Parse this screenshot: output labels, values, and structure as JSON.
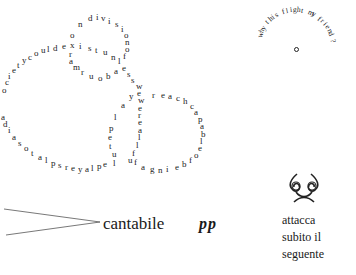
{
  "graphic_text": {
    "loop_letters": [
      {
        "c": "n",
        "x": 78,
        "y": 20
      },
      {
        "c": "d",
        "x": 88,
        "y": 14
      },
      {
        "c": "i",
        "x": 96,
        "y": 13
      },
      {
        "c": "v",
        "x": 101,
        "y": 14
      },
      {
        "c": "i",
        "x": 108,
        "y": 17
      },
      {
        "c": "s",
        "x": 115,
        "y": 20
      },
      {
        "c": "i",
        "x": 121,
        "y": 25
      },
      {
        "c": "o",
        "x": 124,
        "y": 31
      },
      {
        "c": "n",
        "x": 125,
        "y": 38
      },
      {
        "c": "o",
        "x": 125,
        "y": 45
      },
      {
        "c": "f",
        "x": 123,
        "y": 52
      },
      {
        "c": "o",
        "x": 70,
        "y": 31
      },
      {
        "c": "e",
        "x": 62,
        "y": 42
      },
      {
        "c": "x",
        "x": 70,
        "y": 41
      },
      {
        "c": "i",
        "x": 79,
        "y": 42
      },
      {
        "c": "s",
        "x": 88,
        "y": 44
      },
      {
        "c": "t",
        "x": 95,
        "y": 46
      },
      {
        "c": "u",
        "x": 103,
        "y": 48
      },
      {
        "c": "n",
        "x": 111,
        "y": 53
      },
      {
        "c": "l",
        "x": 118,
        "y": 57
      },
      {
        "c": "e",
        "x": 122,
        "y": 64
      },
      {
        "c": "s",
        "x": 127,
        "y": 70
      },
      {
        "c": "s",
        "x": 131,
        "y": 76
      },
      {
        "c": "r",
        "x": 69,
        "y": 50
      },
      {
        "c": "a",
        "x": 69,
        "y": 57
      },
      {
        "c": "m",
        "x": 73,
        "y": 63
      },
      {
        "c": "r",
        "x": 81,
        "y": 68
      },
      {
        "c": "u",
        "x": 89,
        "y": 72
      },
      {
        "c": "o",
        "x": 98,
        "y": 74
      },
      {
        "c": "b",
        "x": 106,
        "y": 72
      },
      {
        "c": "a",
        "x": 114,
        "y": 67
      },
      {
        "c": "d",
        "x": 53,
        "y": 44
      },
      {
        "c": "l",
        "x": 47,
        "y": 45
      },
      {
        "c": "u",
        "x": 41,
        "y": 46
      },
      {
        "c": "o",
        "x": 34,
        "y": 49
      },
      {
        "c": "c",
        "x": 28,
        "y": 53
      },
      {
        "c": "y",
        "x": 22,
        "y": 56
      },
      {
        "c": "t",
        "x": 17,
        "y": 61
      },
      {
        "c": "e",
        "x": 12,
        "y": 66
      },
      {
        "c": "i",
        "x": 8,
        "y": 72
      },
      {
        "c": "c",
        "x": 5,
        "y": 78
      },
      {
        "c": "o",
        "x": 2,
        "y": 86
      },
      {
        "c": "w",
        "x": 136,
        "y": 82
      },
      {
        "c": "e",
        "x": 137,
        "y": 89
      },
      {
        "c": "w",
        "x": 138,
        "y": 96
      },
      {
        "c": "e",
        "x": 138,
        "y": 104
      },
      {
        "c": "r",
        "x": 138,
        "y": 111
      },
      {
        "c": "e",
        "x": 138,
        "y": 118
      },
      {
        "c": "a",
        "x": 138,
        "y": 126
      },
      {
        "c": "l",
        "x": 138,
        "y": 133
      },
      {
        "c": "l",
        "x": 136,
        "y": 141
      },
      {
        "c": "f",
        "x": 132,
        "y": 149
      },
      {
        "c": "u",
        "x": 128,
        "y": 156
      },
      {
        "c": "y",
        "x": 129,
        "y": 92
      },
      {
        "c": "a",
        "x": 121,
        "y": 101
      },
      {
        "c": "l",
        "x": 114,
        "y": 113
      },
      {
        "c": "p",
        "x": 109,
        "y": 124
      },
      {
        "c": "e",
        "x": 108,
        "y": 133
      },
      {
        "c": "t",
        "x": 109,
        "y": 142
      },
      {
        "c": "u",
        "x": 112,
        "y": 150
      },
      {
        "c": "l",
        "x": 113,
        "y": 159
      },
      {
        "c": "f",
        "x": 134,
        "y": 158
      },
      {
        "c": "a",
        "x": 141,
        "y": 163
      },
      {
        "c": "g",
        "x": 150,
        "y": 165
      },
      {
        "c": "n",
        "x": 158,
        "y": 166
      },
      {
        "c": "i",
        "x": 166,
        "y": 165
      },
      {
        "c": "e",
        "x": 175,
        "y": 163
      },
      {
        "c": "b",
        "x": 182,
        "y": 160
      },
      {
        "c": "f",
        "x": 189,
        "y": 156
      },
      {
        "c": "o",
        "x": 194,
        "y": 151
      },
      {
        "c": "e",
        "x": 198,
        "y": 144
      },
      {
        "c": "l",
        "x": 200,
        "y": 137
      },
      {
        "c": "b",
        "x": 201,
        "y": 130
      },
      {
        "c": "a",
        "x": 200,
        "y": 122
      },
      {
        "c": "p",
        "x": 198,
        "y": 115
      },
      {
        "c": "a",
        "x": 194,
        "y": 108
      },
      {
        "c": "c",
        "x": 190,
        "y": 102
      },
      {
        "c": "h",
        "x": 183,
        "y": 97
      },
      {
        "c": "c",
        "x": 176,
        "y": 94
      },
      {
        "c": "a",
        "x": 168,
        "y": 92
      },
      {
        "c": "e",
        "x": 161,
        "y": 91
      },
      {
        "c": "r",
        "x": 152,
        "y": 91
      },
      {
        "c": "e",
        "x": 103,
        "y": 160
      },
      {
        "c": "p",
        "x": 97,
        "y": 162
      },
      {
        "c": "l",
        "x": 91,
        "y": 164
      },
      {
        "c": "a",
        "x": 85,
        "y": 165
      },
      {
        "c": "y",
        "x": 78,
        "y": 165
      },
      {
        "c": "e",
        "x": 71,
        "y": 164
      },
      {
        "c": "r",
        "x": 65,
        "y": 163
      },
      {
        "c": "s",
        "x": 58,
        "y": 161
      },
      {
        "c": "p",
        "x": 51,
        "y": 159
      },
      {
        "c": "l",
        "x": 45,
        "y": 156
      },
      {
        "c": "a",
        "x": 38,
        "y": 153
      },
      {
        "c": "t",
        "x": 31,
        "y": 149
      },
      {
        "c": "o",
        "x": 24,
        "y": 144
      },
      {
        "c": "s",
        "x": 18,
        "y": 139
      },
      {
        "c": "a",
        "x": 12,
        "y": 133
      },
      {
        "c": "i",
        "x": 8,
        "y": 126
      },
      {
        "c": "d",
        "x": 3,
        "y": 120
      },
      {
        "c": "a",
        "x": 1,
        "y": 113
      }
    ],
    "arc_phrase": "why this flight my friend ?"
  },
  "markings": {
    "tempo": "cantabile",
    "dynamic": "pp",
    "attacca_lines": [
      "attacca",
      "subito il",
      "seguente"
    ]
  },
  "icons": {
    "coda_sign": "double-coda-ornament-icon",
    "hairpin": "decrescendo-hairpin-icon"
  }
}
